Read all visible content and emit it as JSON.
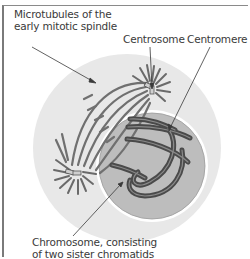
{
  "labels": {
    "microtubules_line1": "Microtubules of the",
    "microtubules_line2": "early mitotic spindle",
    "centrosome": "Centrosome",
    "centromere": "Centromere",
    "chromosome_line1": "Chromosome, consisting",
    "chromosome_line2": "of two sister chromatids"
  },
  "colors": {
    "cell": "#e6e6e6",
    "nucleus": "#b9b9b9",
    "chromosome": "#4a4a4a",
    "microtubule": "#6e6e6e",
    "text": "#3a3a3a"
  }
}
